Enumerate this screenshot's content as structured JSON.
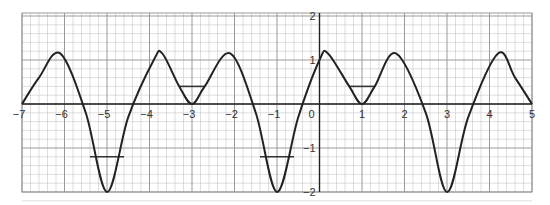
{
  "chart_data": {
    "type": "line",
    "title": "",
    "xlabel": "",
    "ylabel": "",
    "xlim": [
      -7,
      5
    ],
    "ylim": [
      -2,
      2
    ],
    "grid": true,
    "minor_grid_step": 0.2,
    "x_ticks": [
      -7,
      -6,
      -5,
      -4,
      -3,
      -2,
      -1,
      0,
      1,
      2,
      3,
      4,
      5
    ],
    "x_tick_labels": [
      "−7",
      "−6",
      "−5",
      "−4",
      "−3",
      "−2",
      "−1",
      "0",
      "1",
      "2",
      "3",
      "4",
      "5"
    ],
    "y_ticks": [
      -2,
      -1,
      1,
      2
    ],
    "y_tick_labels": [
      "−2",
      "−1",
      "1",
      "2"
    ],
    "period": 4,
    "series": [
      {
        "name": "f(x)",
        "x": [
          -7,
          -6.6,
          -6.1,
          -5.5,
          -5,
          -4.5,
          -3.9,
          -3.7,
          -3.3,
          -3,
          -2.7,
          -2.1,
          -1.5,
          -1,
          -0.5,
          0,
          0.2,
          0.7,
          1,
          1.3,
          1.8,
          2.5,
          3,
          3.5,
          4.2,
          4.6,
          5
        ],
        "y": [
          0,
          0.6,
          1.15,
          -0.2,
          -2,
          -0.3,
          1.0,
          1.15,
          0.4,
          0,
          0.4,
          1.15,
          -0.2,
          -2,
          -0.3,
          1.0,
          1.15,
          0.4,
          0,
          0.4,
          1.15,
          -0.2,
          -2,
          -0.3,
          1.15,
          0.6,
          0
        ]
      }
    ],
    "annotations": [
      {
        "type": "hline_segment",
        "y": -1.2,
        "x_from": -5.4,
        "x_to": -4.6
      },
      {
        "type": "hline_segment",
        "y": 0.4,
        "x_from": -3.3,
        "x_to": -2.7
      },
      {
        "type": "hline_segment",
        "y": -1.2,
        "x_from": -1.4,
        "x_to": -0.6
      },
      {
        "type": "hline_segment",
        "y": 0.4,
        "x_from": 0.7,
        "x_to": 1.3
      }
    ]
  }
}
